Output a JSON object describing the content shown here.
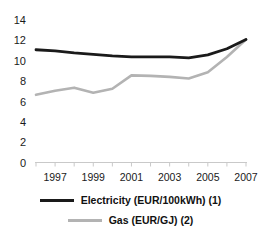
{
  "chart_data": {
    "type": "line",
    "title": "",
    "xlabel": "",
    "ylabel": "",
    "x": [
      1996,
      1997,
      1998,
      1999,
      2000,
      2001,
      2002,
      2003,
      2004,
      2005,
      2006,
      2007
    ],
    "categories": [
      "1996",
      "1997",
      "1998",
      "1999",
      "2000",
      "2001",
      "2002",
      "2003",
      "2004",
      "2005",
      "2006",
      "2007"
    ],
    "xlim": [
      1996,
      2007
    ],
    "ylim": [
      0,
      14
    ],
    "ytick_values": [
      0,
      2,
      4,
      6,
      8,
      10,
      12,
      14
    ],
    "ytick_labels": [
      "0",
      "2",
      "4",
      "6",
      "8",
      "10",
      "12",
      "14"
    ],
    "xtick_values": [
      1997,
      1999,
      2001,
      2003,
      2005,
      2007
    ],
    "xtick_labels": [
      "1997",
      "1999",
      "2001",
      "2003",
      "2005",
      "2007"
    ],
    "grid": false,
    "legend_position": "bottom",
    "series": [
      {
        "name": "Electricity (EUR/100kWh) (1)",
        "color": "#1a1a1a",
        "values": [
          11.0,
          10.9,
          10.7,
          10.55,
          10.4,
          10.3,
          10.3,
          10.3,
          10.2,
          10.5,
          11.1,
          12.0
        ]
      },
      {
        "name": "Gas (EUR/GJ) (2)",
        "color": "#b3b3b3",
        "values": [
          6.6,
          7.0,
          7.3,
          6.8,
          7.2,
          8.5,
          8.45,
          8.35,
          8.2,
          8.8,
          10.3,
          12.0
        ]
      }
    ]
  },
  "legend": {
    "items": [
      {
        "label": "Electricity (EUR/100kWh) (1)",
        "color": "#1a1a1a"
      },
      {
        "label": "Gas (EUR/GJ) (2)",
        "color": "#b3b3b3"
      }
    ]
  },
  "axes": {
    "y_labels": [
      "14",
      "12",
      "10",
      "8",
      "6",
      "4",
      "2",
      "0"
    ],
    "x_labels": [
      "1997",
      "1999",
      "2001",
      "2003",
      "2005",
      "2007"
    ]
  }
}
